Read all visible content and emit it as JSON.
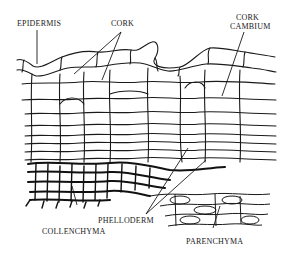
{
  "diagram": {
    "title": "",
    "labels": {
      "epidermis": "EPIDERMIS",
      "cork": "CORK",
      "cork_cambium_line1": "CORK",
      "cork_cambium_line2": "CAMBIUM",
      "phelloderm": "PHELLODERM",
      "collenchyma": "COLLENCHYMA",
      "parenchyma": "PARENCHYMA"
    },
    "colors": {
      "ink": "#1a1a1a",
      "background": "#ffffff"
    }
  }
}
